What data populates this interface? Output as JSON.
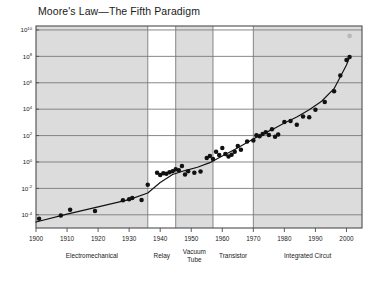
{
  "chart_data": {
    "type": "scatter",
    "title": "Moore's Law—The Fifth Paradigm",
    "xlabel": "",
    "ylabel": "",
    "xlim": [
      1900,
      2005
    ],
    "ylim_log10": [
      -5,
      10.3
    ],
    "yscale": "log",
    "grid": true,
    "legend": "none",
    "xticks": [
      "1900",
      "1910",
      "1920",
      "1930",
      "1940",
      "1950",
      "1960",
      "1970",
      "1980",
      "1990",
      "2000"
    ],
    "xtick_values": [
      1900,
      1910,
      1920,
      1930,
      1940,
      1950,
      1960,
      1970,
      1980,
      1990,
      2000
    ],
    "yticks": [
      {
        "mantissa": "10",
        "exponent": "10"
      },
      {
        "mantissa": "10",
        "exponent": "8"
      },
      {
        "mantissa": "10",
        "exponent": "6"
      },
      {
        "mantissa": "10",
        "exponent": "4"
      },
      {
        "mantissa": "10",
        "exponent": "2"
      },
      {
        "mantissa": "10",
        "exponent": "0"
      },
      {
        "mantissa": "10",
        "exponent": "-2"
      },
      {
        "mantissa": "10",
        "exponent": "-4"
      }
    ],
    "ytick_log10": [
      10,
      8,
      6,
      4,
      2,
      0,
      -2,
      -4
    ],
    "era_bands": [
      {
        "label": "Electromechanical",
        "start": 1900,
        "end": 1936,
        "shaded": true
      },
      {
        "label": "Relay",
        "start": 1936,
        "end": 1945,
        "shaded": false
      },
      {
        "label": "Vacuum\nTube",
        "label_line1": "Vacuum",
        "label_line2": "Tube",
        "start": 1945,
        "end": 1957,
        "shaded": true
      },
      {
        "label": "Transistor",
        "start": 1957,
        "end": 1970,
        "shaded": false
      },
      {
        "label": "Integrated Circut",
        "start": 1970,
        "end": 2005,
        "shaded": true
      }
    ],
    "series": [
      {
        "name": "Computing power per $1000",
        "marker": "filled-circle",
        "color": "#111111",
        "points": [
          [
            1901,
            -4.3
          ],
          [
            1908,
            -4.05
          ],
          [
            1911,
            -3.62
          ],
          [
            1919,
            -3.72
          ],
          [
            1928,
            -2.9
          ],
          [
            1930,
            -2.82
          ],
          [
            1931,
            -2.72
          ],
          [
            1934,
            -2.88
          ],
          [
            1936,
            -1.72
          ],
          [
            1939,
            -0.82
          ],
          [
            1940,
            -0.98
          ],
          [
            1941,
            -0.85
          ],
          [
            1942,
            -0.9
          ],
          [
            1943,
            -0.78
          ],
          [
            1944,
            -0.7
          ],
          [
            1945,
            -0.55
          ],
          [
            1946,
            -0.62
          ],
          [
            1947,
            -0.3
          ],
          [
            1948,
            -0.95
          ],
          [
            1949,
            -0.7
          ],
          [
            1951,
            -0.82
          ],
          [
            1953,
            -0.72
          ],
          [
            1955,
            0.3
          ],
          [
            1956,
            0.45
          ],
          [
            1957,
            0.22
          ],
          [
            1958,
            0.78
          ],
          [
            1959,
            0.52
          ],
          [
            1960,
            1.05
          ],
          [
            1961,
            0.6
          ],
          [
            1962,
            0.42
          ],
          [
            1963,
            0.55
          ],
          [
            1964,
            0.78
          ],
          [
            1965,
            1.22
          ],
          [
            1966,
            0.92
          ],
          [
            1968,
            1.55
          ],
          [
            1970,
            1.62
          ],
          [
            1971,
            2.02
          ],
          [
            1972,
            1.95
          ],
          [
            1973,
            2.12
          ],
          [
            1974,
            2.25
          ],
          [
            1975,
            2.05
          ],
          [
            1976,
            2.48
          ],
          [
            1977,
            1.92
          ],
          [
            1978,
            2.08
          ],
          [
            1980,
            3.02
          ],
          [
            1982,
            3.1
          ],
          [
            1984,
            2.82
          ],
          [
            1986,
            3.45
          ],
          [
            1988,
            3.38
          ],
          [
            1990,
            3.95
          ],
          [
            1993,
            4.55
          ],
          [
            1996,
            5.35
          ],
          [
            1998,
            6.55
          ],
          [
            2000,
            7.72
          ],
          [
            2001,
            7.95
          ]
        ]
      },
      {
        "name": "Projected outlier",
        "marker": "faded-circle",
        "color": "#9a9a9a",
        "points": [
          [
            2001,
            9.55
          ]
        ]
      }
    ],
    "trend_line": {
      "color": "#111111",
      "points": [
        [
          1900,
          -4.55
        ],
        [
          1910,
          -3.95
        ],
        [
          1920,
          -3.4
        ],
        [
          1930,
          -2.85
        ],
        [
          1936,
          -2.35
        ],
        [
          1940,
          -1.55
        ],
        [
          1944,
          -0.95
        ],
        [
          1948,
          -0.65
        ],
        [
          1952,
          -0.4
        ],
        [
          1956,
          -0.05
        ],
        [
          1960,
          0.45
        ],
        [
          1964,
          0.95
        ],
        [
          1968,
          1.48
        ],
        [
          1972,
          2.0
        ],
        [
          1976,
          2.45
        ],
        [
          1980,
          2.95
        ],
        [
          1984,
          3.4
        ],
        [
          1988,
          3.95
        ],
        [
          1992,
          4.6
        ],
        [
          1996,
          5.55
        ],
        [
          2000,
          7.35
        ],
        [
          2001,
          7.95
        ]
      ]
    },
    "colors": {
      "band_shaded": "#dcdcdc",
      "band_plain": "#ffffff",
      "grid": "#7a7a7a",
      "axis": "#4d4d4d",
      "marker": "#111111",
      "outlier": "#9a9a9a",
      "text": "#1a1a1a"
    }
  }
}
